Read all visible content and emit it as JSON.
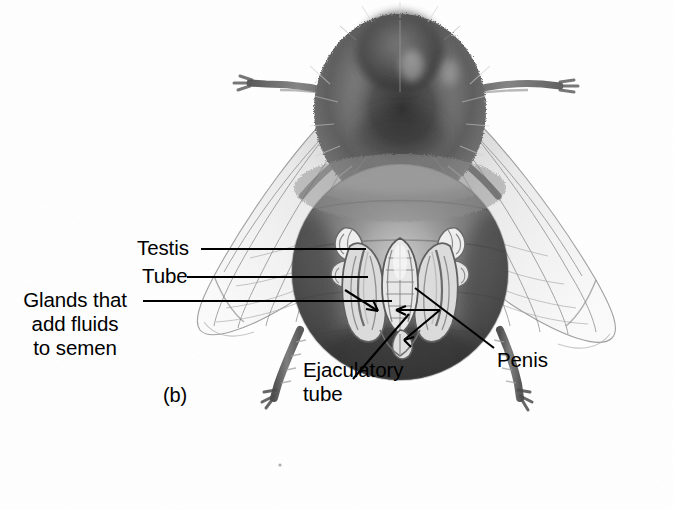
{
  "figure": {
    "panel_label": "(b)",
    "background_color": "#ffffff",
    "ink_color": "#000000"
  },
  "labels": [
    {
      "id": "testis",
      "text": "Testis",
      "leader": "horizontal-line-right"
    },
    {
      "id": "tube",
      "text": "Tube",
      "leader": "horizontal-line-right"
    },
    {
      "id": "glands",
      "text": "Glands that add fluids to semen",
      "line1": "Glands that",
      "line2": "add fluids",
      "line3": "to semen",
      "leader": "horizontal-line-right-with-arrow"
    },
    {
      "id": "ejaculatory",
      "text": "Ejaculatory tube",
      "line1": "Ejaculatory",
      "line2": "tube",
      "leader": "diagonal-line-up-right"
    },
    {
      "id": "penis",
      "text": "Penis",
      "leader": "forked-diagonal-line-up-left"
    }
  ],
  "label_text": {
    "testis": "Testis",
    "tube": "Tube",
    "glands_line1": "Glands that",
    "glands_line2": "add fluids",
    "glands_line3": "to semen",
    "ejaculatory_line1": "Ejaculatory",
    "ejaculatory_line2": "tube",
    "penis": "Penis",
    "panel": "(b)"
  },
  "anatomy_parts": [
    "thorax",
    "abdomen",
    "left-forewing",
    "right-forewing",
    "left-midleg",
    "right-midleg",
    "left-hindleg",
    "right-hindleg",
    "testis-left",
    "testis-right",
    "tube",
    "mucus-gland",
    "ejaculatory-tube",
    "penis"
  ]
}
